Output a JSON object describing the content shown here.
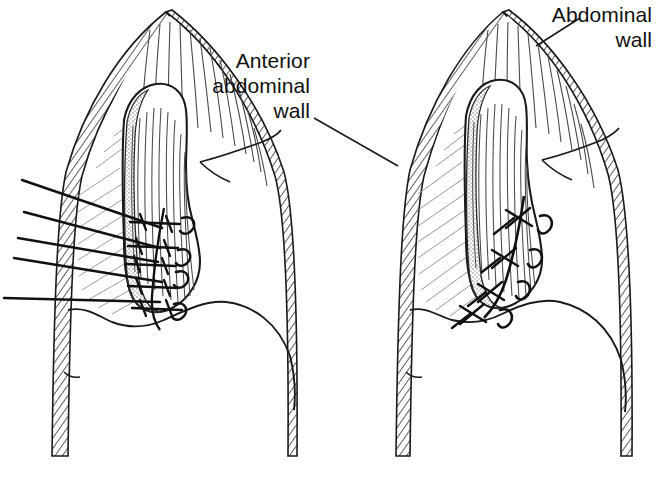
{
  "figure": {
    "type": "anatomical-line-drawing",
    "panels": [
      {
        "id": "left-panel",
        "name": "sutures-placed-untied",
        "description": "Sagittal section of the anterior abdominal wall with muscle flap; interrupted sutures placed through the wall and flap margin but not yet tied.",
        "suture_count": 5,
        "loop_count": 4,
        "state": "untied"
      },
      {
        "id": "right-panel",
        "name": "sutures-tied",
        "description": "Same section after the sutures have been drawn up and tied, apposing the flap to the abdominal wall.",
        "knot_count": 4,
        "loop_count": 4,
        "state": "tied"
      }
    ]
  },
  "labels": {
    "anterior_abdominal_wall": "Anterior\nabdominal\nwall",
    "abdominal_wall": "Abdominal\nwall"
  },
  "colors": {
    "ink": "#111111",
    "background": "#ffffff",
    "hatch": "#6b6b6b",
    "stipple": "#8a8a8a"
  }
}
